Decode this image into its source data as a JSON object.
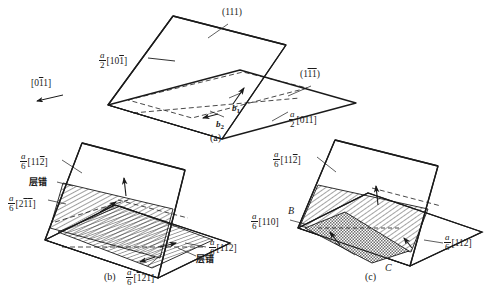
{
  "figure": {
    "title_semantic": "dislocation-dissociation-on-intersecting-111-planes",
    "background_color": "#ffffff",
    "line_color": "#1a1a1a",
    "panels": [
      {
        "id": "a",
        "caption": "(a)",
        "plane_labels": [
          {
            "name": "plane-111-label",
            "text": "(111)"
          },
          {
            "name": "plane-1bar1bar-label",
            "prefix": "(1",
            "bar1": "1",
            "bar2": "1",
            "suffix": ")"
          }
        ],
        "burgers_labels": [
          {
            "name": "burgers-b1",
            "symbol": "b",
            "subscript": "1"
          },
          {
            "name": "burgers-b2",
            "symbol": "b",
            "subscript": "2"
          }
        ],
        "direction_labels": [
          {
            "name": "dir-a2-10bar1",
            "num": "a",
            "den": "2",
            "open": "[10",
            "bar": "1",
            "close": "]"
          },
          {
            "name": "dir-0bar11",
            "plain": true,
            "open": "[0",
            "bar": "1",
            "close": "1]"
          },
          {
            "name": "dir-a2-011",
            "num": "a",
            "den": "2",
            "open": "[011",
            "bar": "",
            "close": "]"
          }
        ]
      },
      {
        "id": "b",
        "caption": "(b)",
        "direction_labels": [
          {
            "name": "dir-a6-11bar2",
            "num": "a",
            "den": "6",
            "open": "[11",
            "bar": "2",
            "close": "]"
          },
          {
            "name": "dir-a6-2bar1bar1",
            "num": "a",
            "den": "6",
            "open": "[2",
            "bar": "1",
            "bar_extra": "1",
            "close": "]"
          },
          {
            "name": "dir-a6-112",
            "num": "a",
            "den": "6",
            "open": "[112",
            "bar": "",
            "close": "]"
          },
          {
            "name": "dir-a6-bar121",
            "num": "a",
            "den": "6",
            "open": "[",
            "bar": "1",
            "close": "21]"
          }
        ],
        "fault_labels": [
          {
            "name": "stacking-fault-upper",
            "text": "层错"
          },
          {
            "name": "stacking-fault-lower",
            "text": "层错"
          }
        ]
      },
      {
        "id": "c",
        "caption": "(c)",
        "direction_labels": [
          {
            "name": "dir-a6-11bar2",
            "num": "a",
            "den": "6",
            "open": "[11",
            "bar": "2",
            "close": "]"
          },
          {
            "name": "dir-a6-110",
            "num": "a",
            "den": "6",
            "open": "[110",
            "bar": "",
            "close": "]"
          },
          {
            "name": "dir-a6-112",
            "num": "a",
            "den": "6",
            "open": "[112",
            "bar": "",
            "close": "]"
          }
        ],
        "point_labels": [
          {
            "name": "point-b",
            "text": "B"
          },
          {
            "name": "point-c",
            "text": "C"
          }
        ]
      }
    ]
  }
}
